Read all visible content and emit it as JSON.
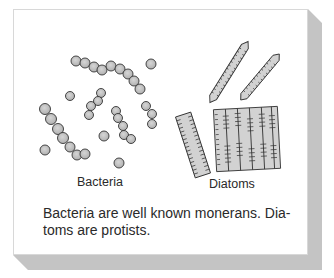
{
  "figure": {
    "labels": {
      "bacteria": "Bacteria",
      "diatoms": "Diatoms"
    },
    "caption": {
      "line1": "Bacteria are well known monerans. Dia-",
      "line2": "toms are protists."
    },
    "colors": {
      "card": "#ffffff",
      "shadow": "#c4c4c4",
      "cell_fill": "#c9c9c9",
      "outline": "#333333",
      "text": "#2a2a2a"
    }
  }
}
